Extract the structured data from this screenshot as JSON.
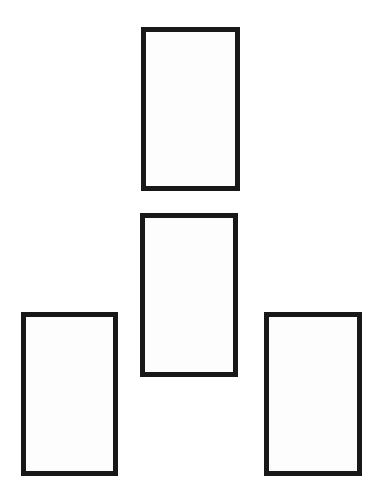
{
  "document": {
    "title": "Rectangle Arrangement Diagram",
    "background_color": "#ffffff",
    "canvas": {
      "width": 493,
      "height": 493,
      "width_px": 381
    }
  },
  "style": {
    "stroke_color": "#181818",
    "fill_color": "#fdfdfd",
    "stroke_width_px": 5
  },
  "shapes": [
    {
      "name": "top-center-rectangle",
      "label": "",
      "kind": "rectangle",
      "position": "top-center",
      "x": 141,
      "y": 27,
      "width": 99,
      "height": 164,
      "stroke_width": 5,
      "stroke_color": "#181818",
      "fill_color": "#fdfdfd"
    },
    {
      "name": "middle-center-rectangle",
      "label": "",
      "kind": "rectangle",
      "position": "middle-center",
      "x": 140,
      "y": 213,
      "width": 98,
      "height": 164,
      "stroke_width": 5,
      "stroke_color": "#181818",
      "fill_color": "#fdfdfd"
    },
    {
      "name": "bottom-left-rectangle",
      "label": "",
      "kind": "rectangle",
      "position": "bottom-left",
      "x": 21,
      "y": 312,
      "width": 97,
      "height": 164,
      "stroke_width": 5,
      "stroke_color": "#181818",
      "fill_color": "#fdfdfd"
    },
    {
      "name": "bottom-right-rectangle",
      "label": "",
      "kind": "rectangle",
      "position": "bottom-right",
      "x": 264,
      "y": 312,
      "width": 98,
      "height": 164,
      "stroke_width": 5,
      "stroke_color": "#181818",
      "fill_color": "#fdfdfd"
    }
  ]
}
